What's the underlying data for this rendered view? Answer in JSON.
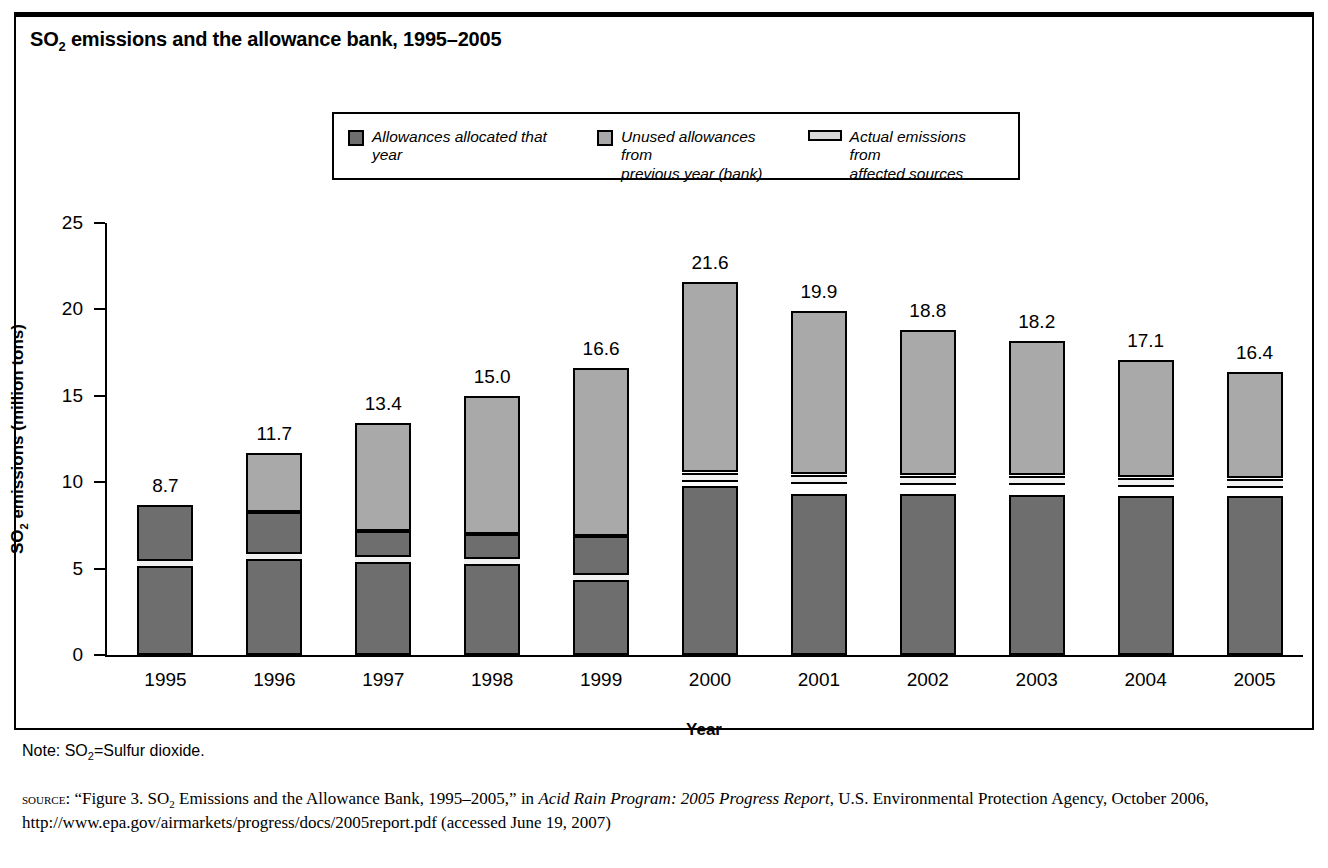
{
  "figure": {
    "title_main": "SO",
    "title_sub": "2",
    "title_rest": " emissions and the allowance bank, 1995–2005"
  },
  "legend": {
    "items": [
      {
        "name": "allowances-allocated",
        "label": "Allowances allocated that year",
        "swatch": "filled-square",
        "color": "#6e6e6e"
      },
      {
        "name": "unused-allowances-bank",
        "label": "Unused allowances from\nprevious year (bank)",
        "swatch": "filled-square",
        "color": "#a9a9a9"
      },
      {
        "name": "actual-emissions",
        "label": "Actual emissions from\naffected sources",
        "swatch": "horizontal-bar",
        "color": "#d8d8d8"
      }
    ]
  },
  "axes": {
    "y_label_main": "SO",
    "y_label_sub": "2",
    "y_label_rest": " emissions (million tons)",
    "y_ticks": [
      "0",
      "5",
      "10",
      "15",
      "20",
      "25"
    ],
    "y_min": 0,
    "y_max": 25,
    "x_label": "Year"
  },
  "notes": {
    "note_pre": "Note: SO",
    "note_sub": "2",
    "note_post": "=Sulfur dioxide.",
    "source_label": "source",
    "source_p1": ": “Figure 3. SO",
    "source_sub": "2",
    "source_p2": " Emissions and the Allowance Bank, 1995–2005,” in ",
    "source_italic": "Acid Rain Program: 2005 Progress Report",
    "source_p3": ", U.S. Environmental Protection Agency, October 2006, http://www.epa.gov/airmarkets/progress/docs/2005report.pdf (accessed June 19, 2007)"
  },
  "chart_data": {
    "type": "bar",
    "title": "SO2 emissions and the allowance bank, 1995–2005",
    "xlabel": "Year",
    "ylabel": "SO2 emissions (million tons)",
    "ylim": [
      0,
      25
    ],
    "ytick_step": 5,
    "grid": false,
    "legend_position": "top-center",
    "stacked": true,
    "categories": [
      "1995",
      "1996",
      "1997",
      "1998",
      "1999",
      "2000",
      "2001",
      "2002",
      "2003",
      "2004",
      "2005"
    ],
    "total_labels": [
      "8.7",
      "11.7",
      "13.4",
      "15.0",
      "16.6",
      "21.6",
      "19.9",
      "18.8",
      "18.2",
      "17.1",
      "16.4"
    ],
    "totals": [
      8.7,
      11.7,
      13.4,
      15.0,
      16.6,
      21.6,
      19.9,
      18.8,
      18.2,
      17.1,
      16.4
    ],
    "series": [
      {
        "name": "Allowances allocated that year",
        "color": "#6e6e6e",
        "values": [
          8.7,
          8.3,
          7.2,
          7.0,
          6.9,
          9.8,
          9.3,
          9.3,
          9.2,
          9.2,
          9.2
        ]
      },
      {
        "name": "Unused allowances from previous year (bank)",
        "color": "#a9a9a9",
        "values": [
          0.0,
          3.4,
          6.2,
          8.0,
          9.7,
          11.8,
          10.6,
          9.5,
          9.0,
          7.9,
          7.2
        ]
      },
      {
        "name": "Actual emissions from affected sources",
        "color": "#f2f2f2",
        "values": [
          5.3,
          5.7,
          5.5,
          5.4,
          4.5,
          10.2,
          10.2,
          10.2,
          10.2,
          10.2,
          10.2
        ]
      }
    ],
    "bars": [
      {
        "year": "1995",
        "total": 8.7,
        "allocated_top": 8.7,
        "emissions": 5.3,
        "bank_bottom": 8.7
      },
      {
        "year": "1996",
        "total": 11.7,
        "allocated_top": 8.3,
        "emissions": 5.7,
        "bank_bottom": 8.3
      },
      {
        "year": "1997",
        "total": 13.4,
        "allocated_top": 7.2,
        "emissions": 5.5,
        "bank_bottom": 7.2
      },
      {
        "year": "1998",
        "total": 15.0,
        "allocated_top": 7.0,
        "emissions": 5.4,
        "bank_bottom": 7.0
      },
      {
        "year": "1999",
        "total": 16.6,
        "allocated_top": 6.9,
        "emissions": 4.5,
        "bank_bottom": 6.9
      },
      {
        "year": "2000",
        "total": 21.6,
        "allocated_top": 9.8,
        "emissions": 10.25,
        "bank_bottom": 10.6
      },
      {
        "year": "2001",
        "total": 19.9,
        "allocated_top": 9.3,
        "emissions": 10.15,
        "bank_bottom": 10.5
      },
      {
        "year": "2002",
        "total": 18.8,
        "allocated_top": 9.3,
        "emissions": 10.1,
        "bank_bottom": 10.4
      },
      {
        "year": "2003",
        "total": 18.2,
        "allocated_top": 9.25,
        "emissions": 10.1,
        "bank_bottom": 10.4
      },
      {
        "year": "2004",
        "total": 17.1,
        "allocated_top": 9.2,
        "emissions": 10.0,
        "bank_bottom": 10.3
      },
      {
        "year": "2005",
        "total": 16.4,
        "allocated_top": 9.2,
        "emissions": 9.95,
        "bank_bottom": 10.25
      }
    ]
  }
}
